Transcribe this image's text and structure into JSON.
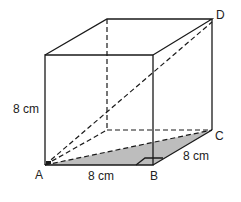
{
  "figure": {
    "type": "cube",
    "vertices": {
      "A": "front-bottom-left",
      "B": "front-bottom-right",
      "C": "back-bottom-right",
      "D": "back-top-right"
    },
    "labels": {
      "A": "A",
      "B": "B",
      "C": "C",
      "D": "D",
      "height": "8 cm",
      "width_AB": "8 cm",
      "depth_BC": "8 cm"
    },
    "shaded_region": "triangle ABC",
    "diagonals": [
      "AC (face diagonal, dashed)",
      "AD (space diagonal, dashed)"
    ],
    "right_angle_markers": [
      "A",
      "B"
    ],
    "colors": {
      "line": "#1a1a1a",
      "shade": "#bdbdbd"
    }
  }
}
